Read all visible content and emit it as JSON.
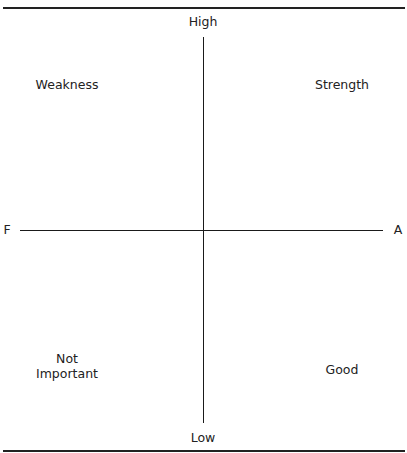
{
  "diagram": {
    "type": "quadrant-matrix",
    "axes": {
      "vertical": {
        "top_label": "High",
        "bottom_label": "Low"
      },
      "horizontal": {
        "left_label": "F",
        "right_label": "A"
      }
    },
    "quadrants": {
      "top_left": {
        "label": "Weakness"
      },
      "top_right": {
        "label": "Strength"
      },
      "bottom_left": {
        "label_lines": [
          "Not",
          "Important"
        ]
      },
      "bottom_right": {
        "label": "Good"
      }
    }
  }
}
